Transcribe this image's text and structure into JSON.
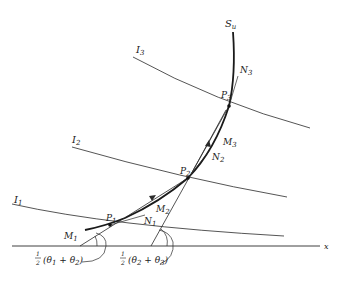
{
  "diagram": {
    "colors": {
      "line": "#2a2a2a",
      "background": "#ffffff"
    },
    "curve_label": "S",
    "curve_label_sub": "u",
    "axis_label": "x",
    "isolines": [
      {
        "name": "I",
        "sub": "1"
      },
      {
        "name": "I",
        "sub": "2"
      },
      {
        "name": "I",
        "sub": "3"
      }
    ],
    "points": [
      {
        "name": "P",
        "sub": "1"
      },
      {
        "name": "P",
        "sub": "2"
      },
      {
        "name": "P",
        "sub": "3"
      }
    ],
    "chords": [
      {
        "name": "M",
        "sub": "1"
      },
      {
        "name": "M",
        "sub": "2"
      },
      {
        "name": "M",
        "sub": "3"
      }
    ],
    "normals": [
      {
        "name": "N",
        "sub": "1"
      },
      {
        "name": "N",
        "sub": "2"
      },
      {
        "name": "N",
        "sub": "3"
      }
    ],
    "angle_labels": [
      {
        "frac": "1/2",
        "text": "(θ",
        "a": "1",
        "plus": " + θ",
        "b": "2",
        "close": ")"
      },
      {
        "frac": "1/2",
        "text": "(θ",
        "a": "2",
        "plus": " + θ",
        "b": "3",
        "close": ")"
      }
    ]
  }
}
